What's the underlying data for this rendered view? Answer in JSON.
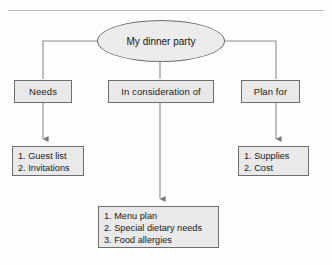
{
  "diagram": {
    "type": "concept-map",
    "root": {
      "id": "root",
      "shape": "ellipse",
      "label": "My dinner party"
    },
    "categories": [
      {
        "id": "needs",
        "label": "Needs"
      },
      {
        "id": "consider",
        "label": "In consideration of"
      },
      {
        "id": "plan",
        "label": "Plan for"
      }
    ],
    "lists": [
      {
        "id": "needs-list",
        "parent": "needs",
        "items": [
          "1. Guest list",
          "2. Invitations"
        ]
      },
      {
        "id": "consider-list",
        "parent": "consider",
        "items": [
          "1. Menu plan",
          "2. Special dietary needs",
          "3. Food allergies"
        ]
      },
      {
        "id": "plan-list",
        "parent": "plan",
        "items": [
          "1. Supplies",
          "2. Cost"
        ]
      }
    ],
    "style": {
      "node_fill": "#e9e9e9",
      "node_border": "#6e6e6e",
      "connector": "#8a8a8a",
      "text": "#1a1a1a",
      "page_background": "#fdfdfd",
      "rule": "#b9b9b9"
    }
  }
}
